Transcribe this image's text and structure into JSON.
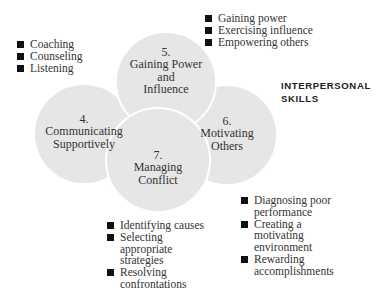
{
  "heading": {
    "line1": "INTERPERSONAL",
    "line2": "SKILLS"
  },
  "colors": {
    "circle_fill": "#e6e6e6",
    "circle_stroke": "#ffffff",
    "bullet": "#111111",
    "text": "#333333"
  },
  "circles": [
    {
      "id": "4",
      "number": "4.",
      "lines": [
        "Communicating",
        "Supportively"
      ],
      "cx": 84,
      "cy": 134,
      "r": 50
    },
    {
      "id": "5",
      "number": "5.",
      "lines": [
        "Gaining Power",
        "and",
        "Influence"
      ],
      "cx": 166,
      "cy": 82,
      "r": 50
    },
    {
      "id": "6",
      "number": "6.",
      "lines": [
        "Motivating",
        "Others"
      ],
      "cx": 227,
      "cy": 135,
      "r": 50
    },
    {
      "id": "7",
      "number": "7.",
      "lines": [
        "Managing",
        "Conflict"
      ],
      "cx": 158,
      "cy": 160,
      "r": 52
    }
  ],
  "bullet_groups": {
    "communicating": [
      "Coaching",
      "Counseling",
      "Listening"
    ],
    "gaining_power": [
      "Gaining power",
      "Exercising influence",
      "Empowering others"
    ],
    "managing_conflict": [
      "Identifying causes",
      "Selecting appropriate strategies",
      "Resolving confrontations"
    ],
    "motivating": [
      "Diagnosing poor performance",
      "Creating a motivating environment",
      "Rewarding accomplishments"
    ]
  }
}
